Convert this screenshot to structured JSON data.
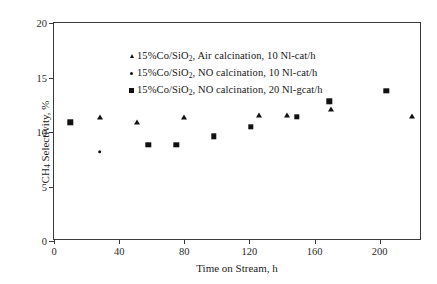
{
  "chart_data": {
    "type": "scatter",
    "title": "",
    "xlabel": "Time on Stream, h",
    "ylabel_html": "CH<sub>4</sub> Selectivity, %",
    "ylabel_text": "CH4 Selectivity, %",
    "xlim": [
      0,
      226
    ],
    "ylim": [
      0,
      20
    ],
    "xticks": [
      0,
      40,
      80,
      120,
      160,
      200
    ],
    "yticks": [
      0,
      5,
      10,
      15,
      20
    ],
    "grid": false,
    "legend_position": "upper-left-inside",
    "series": [
      {
        "name": "15%Co/SiO2, Air calcination, 10 Nl-cat/h",
        "name_html": "15%Co/SiO<sub>2</sub>, Air calcination, 10 Nl-cat/h",
        "marker": "triangle",
        "color": "#111111",
        "points": [
          {
            "x": 28,
            "y": 11.4
          },
          {
            "x": 51,
            "y": 10.9
          },
          {
            "x": 80,
            "y": 11.4
          },
          {
            "x": 126,
            "y": 11.6
          },
          {
            "x": 143,
            "y": 11.6
          },
          {
            "x": 170,
            "y": 12.1
          },
          {
            "x": 220,
            "y": 11.5
          }
        ]
      },
      {
        "name": "15%Co/SiO2, NO calcination, 10 Nl-cat/h",
        "name_html": "15%Co/SiO<sub>2</sub>, NO calcination, 10 Nl-cat/h",
        "marker": "circle",
        "color": "#111111",
        "points": [
          {
            "x": 28,
            "y": 8.2
          }
        ]
      },
      {
        "name": "15%Co/SiO2, NO calcination, 20 Nl-gcat/h",
        "name_html": "15%Co/SiO<sub>2</sub>, NO calcination, 20 Nl-gcat/h",
        "marker": "square",
        "color": "#111111",
        "points": [
          {
            "x": 10,
            "y": 10.9
          },
          {
            "x": 58,
            "y": 8.8
          },
          {
            "x": 75,
            "y": 8.8
          },
          {
            "x": 98,
            "y": 9.6
          },
          {
            "x": 121,
            "y": 10.5
          },
          {
            "x": 149,
            "y": 11.4
          },
          {
            "x": 169,
            "y": 12.8
          },
          {
            "x": 204,
            "y": 13.8
          }
        ]
      }
    ]
  }
}
